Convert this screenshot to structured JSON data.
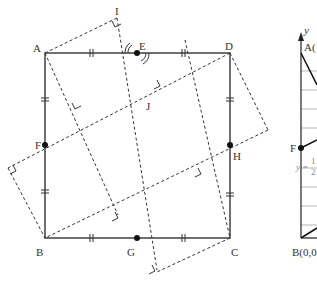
{
  "figure": {
    "left_diagram": {
      "description": "Square ABCD with midpoints E, F, G, H and dashed rotated squares",
      "points": {
        "A": {
          "label": "A",
          "x": 45,
          "y": 53
        },
        "D": {
          "label": "D",
          "x": 230,
          "y": 53
        },
        "B": {
          "label": "B",
          "x": 45,
          "y": 238
        },
        "C": {
          "label": "C",
          "x": 230,
          "y": 238
        },
        "E": {
          "label": "E",
          "x": 137,
          "y": 53
        },
        "F": {
          "label": "F",
          "x": 45,
          "y": 145
        },
        "G": {
          "label": "G",
          "x": 137,
          "y": 238
        },
        "H": {
          "label": "H",
          "x": 230,
          "y": 145
        },
        "I": {
          "label": "I",
          "x": 117,
          "y": 18
        },
        "J": {
          "label": "J",
          "x": 150,
          "y": 96
        }
      }
    },
    "right_graph": {
      "axis_label_y": "y",
      "point_A_label": "A(",
      "point_F_label": "F",
      "point_B_label": "B(0,0",
      "equation_prefix": "y =",
      "equation_num": "1",
      "equation_den": "2"
    }
  }
}
